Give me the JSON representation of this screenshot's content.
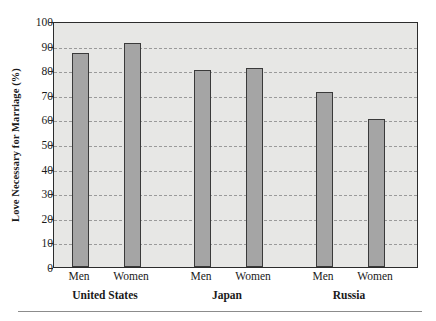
{
  "chart_data": {
    "type": "bar",
    "title": "",
    "subtitle": "",
    "xlabel": "",
    "ylabel": "Love Necessary for Marriage (%)",
    "ylim": [
      0,
      100
    ],
    "ytick_step": 10,
    "yticks": [
      0,
      10,
      20,
      30,
      40,
      50,
      60,
      70,
      80,
      90,
      100
    ],
    "ytick_labels": [
      "0",
      "10",
      "20",
      "30",
      "40",
      "50",
      "60",
      "70",
      "80",
      "90",
      "100"
    ],
    "grid": true,
    "grid_style": "dashed",
    "legend": false,
    "legend_position": "none",
    "categories": [
      "Men",
      "Women",
      "Men",
      "Women",
      "Men",
      "Women"
    ],
    "groups": [
      {
        "label": "United States",
        "members": [
          "Men",
          "Women"
        ]
      },
      {
        "label": "Japan",
        "members": [
          "Men",
          "Women"
        ]
      },
      {
        "label": "Russia",
        "members": [
          "Men",
          "Women"
        ]
      }
    ],
    "bars": [
      {
        "group": "United States",
        "category": "Men",
        "value": 87
      },
      {
        "group": "United States",
        "category": "Women",
        "value": 91
      },
      {
        "group": "Japan",
        "category": "Men",
        "value": 80
      },
      {
        "group": "Japan",
        "category": "Women",
        "value": 81
      },
      {
        "group": "Russia",
        "category": "Men",
        "value": 71
      },
      {
        "group": "Russia",
        "category": "Women",
        "value": 60
      }
    ],
    "values": [
      87,
      91,
      80,
      81,
      71,
      60
    ],
    "colors": {
      "bar_fill": "#a5a5a5",
      "bar_border": "#3a3a3a",
      "plot_background": "#e7e7e5",
      "frame": "#2c2c2c",
      "gridline": "#9a9a9a",
      "text": "#1a1a1a",
      "page_background": "#ffffff",
      "rule": "#8c8c8c"
    }
  }
}
